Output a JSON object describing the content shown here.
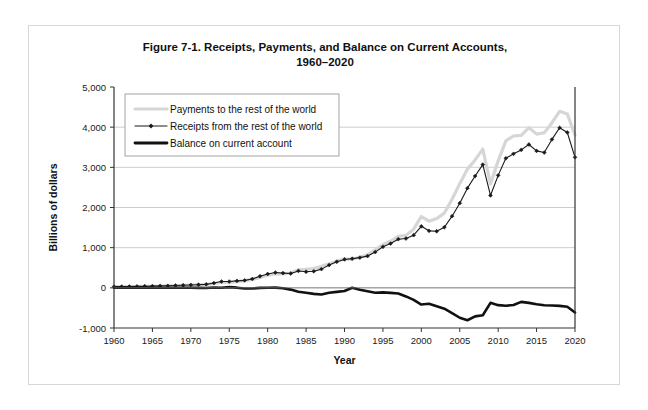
{
  "figure": {
    "title_line1": "Figure 7-1. Receipts, Payments, and Balance on Current Accounts,",
    "title_line2": "1960–2020"
  },
  "chart_data": {
    "type": "line",
    "title": "Figure 7-1. Receipts, Payments, and Balance on Current Accounts, 1960–2020",
    "xlabel": "Year",
    "ylabel": "Billions of dollars",
    "xlim": [
      1960,
      2020
    ],
    "ylim": [
      -1000,
      5000
    ],
    "ytick_labels": [
      "5,000",
      "4,000",
      "3,000",
      "2,000",
      "1,000",
      "0",
      "-1,000"
    ],
    "ytick_values": [
      5000,
      4000,
      3000,
      2000,
      1000,
      0,
      -1000
    ],
    "xtick_labels": [
      "1960",
      "1965",
      "1970",
      "1975",
      "1980",
      "1985",
      "1990",
      "1995",
      "2000",
      "2005",
      "2010",
      "2015",
      "2020"
    ],
    "xtick_values": [
      1960,
      1965,
      1970,
      1975,
      1980,
      1985,
      1990,
      1995,
      2000,
      2005,
      2010,
      2015,
      2020
    ],
    "grid": "horizontal",
    "legend_position": "upper-left-inside",
    "x": [
      1960,
      1961,
      1962,
      1963,
      1964,
      1965,
      1966,
      1967,
      1968,
      1969,
      1970,
      1971,
      1972,
      1973,
      1974,
      1975,
      1976,
      1977,
      1978,
      1979,
      1980,
      1981,
      1982,
      1983,
      1984,
      1985,
      1986,
      1987,
      1988,
      1989,
      1990,
      1991,
      1992,
      1993,
      1994,
      1995,
      1996,
      1997,
      1998,
      1999,
      2000,
      2001,
      2002,
      2003,
      2004,
      2005,
      2006,
      2007,
      2008,
      2009,
      2010,
      2011,
      2012,
      2013,
      2014,
      2015,
      2016,
      2017,
      2018,
      2019,
      2020
    ],
    "series": [
      {
        "name": "Payments to the rest of the world",
        "color": "#d6d6d6",
        "style": "thick-solid",
        "marker": "none",
        "values": [
          28,
          28,
          30,
          32,
          35,
          39,
          45,
          49,
          56,
          63,
          71,
          78,
          86,
          105,
          139,
          133,
          153,
          179,
          209,
          257,
          313,
          348,
          345,
          369,
          452,
          460,
          482,
          535,
          596,
          663,
          721,
          710,
          762,
          826,
          948,
          1077,
          1160,
          1281,
          1306,
          1461,
          1775,
          1660,
          1724,
          1861,
          2207,
          2594,
          2956,
          3184,
          3455,
          2587,
          3161,
          3660,
          3780,
          3796,
          3988,
          3827,
          3862,
          4111,
          4394,
          4330,
          3800
        ]
      },
      {
        "name": "Receipts from the rest of the world",
        "color": "#1a1a1a",
        "style": "thin-solid",
        "marker": "diamond",
        "values": [
          30,
          31,
          33,
          36,
          40,
          44,
          48,
          51,
          58,
          64,
          72,
          78,
          87,
          119,
          157,
          157,
          173,
          185,
          221,
          288,
          345,
          381,
          367,
          357,
          420,
          400,
          412,
          466,
          567,
          650,
          707,
          727,
          752,
          790,
          890,
          1022,
          1102,
          1211,
          1228,
          1312,
          1532,
          1419,
          1409,
          1509,
          1784,
          2107,
          2482,
          2783,
          3068,
          2300,
          2800,
          3225,
          3337,
          3434,
          3568,
          3409,
          3368,
          3695,
          3984,
          3868,
          3250
        ]
      },
      {
        "name": "Balance on current account",
        "color": "#111111",
        "style": "thick-solid",
        "marker": "none",
        "values": [
          2,
          3,
          3,
          4,
          5,
          5,
          3,
          2,
          1,
          1,
          2,
          -1,
          -6,
          7,
          2,
          18,
          4,
          -15,
          -16,
          -1,
          2,
          5,
          -11,
          -44,
          -99,
          -124,
          -150,
          -167,
          -122,
          -100,
          -79,
          3,
          -50,
          -85,
          -122,
          -114,
          -125,
          -141,
          -214,
          -300,
          -416,
          -397,
          -458,
          -520,
          -629,
          -745,
          -807,
          -711,
          -682,
          -373,
          -431,
          -446,
          -427,
          -349,
          -374,
          -408,
          -433,
          -440,
          -450,
          -472,
          -616
        ]
      }
    ]
  }
}
